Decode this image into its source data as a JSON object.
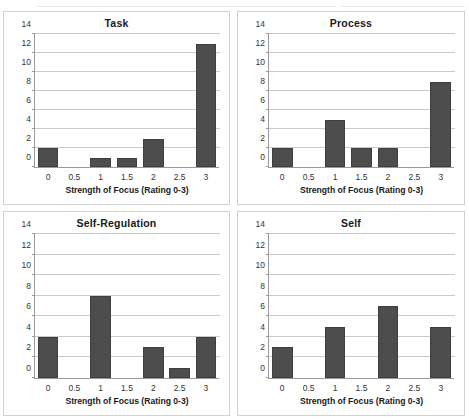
{
  "figure": {
    "background_color": "#ffffff",
    "bar_color": "#4d4d4d",
    "gridline_color": "#c9c9c9",
    "axis_color": "#9a9a9a",
    "panel_border_color": "#d2d2d2"
  },
  "chart_data": [
    {
      "type": "bar",
      "title": "Task",
      "xlabel": "Strength of Focus (Rating 0-3)",
      "ylabel": "",
      "categories": [
        "0",
        "0.5",
        "1",
        "1.5",
        "2",
        "2.5",
        "3"
      ],
      "values": [
        2,
        0,
        1,
        1,
        3,
        0,
        13
      ],
      "ylim": [
        0,
        14
      ],
      "yticks": [
        0,
        2,
        4,
        6,
        8,
        10,
        12,
        14
      ],
      "grid": true,
      "legend": "none"
    },
    {
      "type": "bar",
      "title": "Process",
      "xlabel": "Strength of Focus (Rating 0-3)",
      "ylabel": "",
      "categories": [
        "0",
        "0.5",
        "1",
        "1.5",
        "2",
        "2.5",
        "3"
      ],
      "values": [
        2,
        0,
        5,
        2,
        2,
        0,
        9
      ],
      "ylim": [
        0,
        14
      ],
      "yticks": [
        0,
        2,
        4,
        6,
        8,
        10,
        12,
        14
      ],
      "grid": true,
      "legend": "none"
    },
    {
      "type": "bar",
      "title": "Self-Regulation",
      "xlabel": "Strength of Focus (Rating 0-3)",
      "ylabel": "",
      "categories": [
        "0",
        "0.5",
        "1",
        "1.5",
        "2",
        "2.5",
        "3"
      ],
      "values": [
        4,
        0,
        8,
        0,
        3,
        1,
        4
      ],
      "ylim": [
        0,
        14
      ],
      "yticks": [
        0,
        2,
        4,
        6,
        8,
        10,
        12,
        14
      ],
      "grid": true,
      "legend": "none"
    },
    {
      "type": "bar",
      "title": "Self",
      "xlabel": "Strength of Focus (Rating 0-3)",
      "ylabel": "",
      "categories": [
        "0",
        "0.5",
        "1",
        "1.5",
        "2",
        "2.5",
        "3"
      ],
      "values": [
        3,
        0,
        5,
        0,
        7,
        0,
        5
      ],
      "ylim": [
        0,
        14
      ],
      "yticks": [
        0,
        2,
        4,
        6,
        8,
        10,
        12,
        14
      ],
      "grid": true,
      "legend": "none"
    }
  ]
}
